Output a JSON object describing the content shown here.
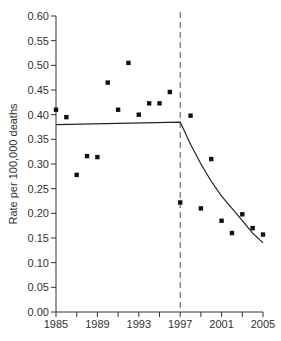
{
  "chart_data": {
    "type": "scatter",
    "title": "",
    "xlabel": "",
    "ylabel": "Rate per 100,000 deaths",
    "xlim": [
      1985,
      2005
    ],
    "ylim": [
      0,
      0.6
    ],
    "x_ticks": [
      "1985",
      "1989",
      "1993",
      "1997",
      "2001",
      "2005"
    ],
    "y_ticks": [
      "0.00",
      "0.05",
      "0.10",
      "0.15",
      "0.20",
      "0.25",
      "0.30",
      "0.35",
      "0.40",
      "0.45",
      "0.50",
      "0.55",
      "0.60"
    ],
    "grid": false,
    "breakpoint": {
      "x": 1997,
      "style": "dashed"
    },
    "points": {
      "x": [
        1985,
        1986,
        1987,
        1988,
        1989,
        1990,
        1991,
        1992,
        1993,
        1994,
        1995,
        1996,
        1997,
        1998,
        1999,
        2000,
        2001,
        2002,
        2003,
        2004,
        2005
      ],
      "y": [
        0.41,
        0.395,
        0.278,
        0.316,
        0.314,
        0.465,
        0.41,
        0.505,
        0.4,
        0.423,
        0.423,
        0.446,
        0.222,
        0.398,
        0.21,
        0.31,
        0.185,
        0.16,
        0.198,
        0.17,
        0.157
      ]
    },
    "trend": {
      "x": [
        1985,
        1997,
        1998,
        1999,
        2000,
        2001,
        2002,
        2003,
        2004,
        2005
      ],
      "y": [
        0.38,
        0.385,
        0.34,
        0.3,
        0.265,
        0.235,
        0.21,
        0.185,
        0.16,
        0.14
      ]
    }
  }
}
